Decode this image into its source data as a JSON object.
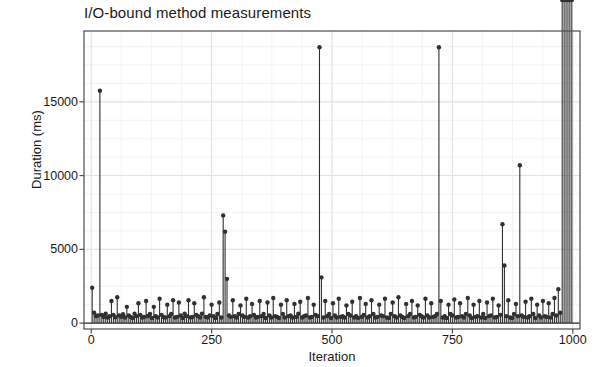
{
  "chart_data": {
    "type": "line",
    "style": "stem",
    "title": "I/O-bound method measurements",
    "xlabel": "Iteration",
    "ylabel": "Duration (ms)",
    "xlim": [
      -15,
      1015
    ],
    "ylim": [
      -400,
      19800
    ],
    "grid": true,
    "grid_minor": true,
    "legend": null,
    "marker": "circle",
    "series_color": "#303030",
    "xticks": [
      0,
      250,
      500,
      750,
      1000
    ],
    "xtick_labels": [
      "0",
      "250",
      "500",
      "750",
      "1000"
    ],
    "yticks": [
      0,
      5000,
      10000,
      15000
    ],
    "ytick_labels": [
      "0",
      "5000",
      "10000",
      "15000"
    ],
    "x": [
      2,
      6,
      10,
      14,
      18,
      22,
      26,
      30,
      34,
      38,
      42,
      46,
      50,
      54,
      58,
      62,
      66,
      70,
      74,
      78,
      82,
      86,
      90,
      94,
      98,
      102,
      106,
      110,
      114,
      118,
      122,
      126,
      130,
      134,
      138,
      142,
      146,
      150,
      154,
      158,
      162,
      166,
      170,
      174,
      178,
      182,
      186,
      190,
      194,
      198,
      202,
      206,
      210,
      214,
      218,
      222,
      226,
      230,
      234,
      238,
      242,
      246,
      250,
      254,
      258,
      262,
      266,
      270,
      274,
      278,
      282,
      286,
      290,
      294,
      298,
      302,
      306,
      310,
      314,
      318,
      322,
      326,
      330,
      334,
      338,
      342,
      346,
      350,
      354,
      358,
      362,
      366,
      370,
      374,
      378,
      382,
      386,
      390,
      394,
      398,
      402,
      406,
      410,
      414,
      418,
      422,
      426,
      430,
      434,
      438,
      442,
      446,
      450,
      454,
      458,
      462,
      466,
      470,
      474,
      478,
      482,
      486,
      490,
      494,
      498,
      502,
      506,
      510,
      514,
      518,
      522,
      526,
      530,
      534,
      538,
      542,
      546,
      550,
      554,
      558,
      562,
      566,
      570,
      574,
      578,
      582,
      586,
      590,
      594,
      598,
      602,
      606,
      610,
      614,
      618,
      622,
      626,
      630,
      634,
      638,
      642,
      646,
      650,
      654,
      658,
      662,
      666,
      670,
      674,
      678,
      682,
      686,
      690,
      694,
      698,
      702,
      706,
      710,
      714,
      718,
      722,
      726,
      730,
      734,
      738,
      742,
      746,
      750,
      754,
      758,
      762,
      766,
      770,
      774,
      778,
      782,
      786,
      790,
      794,
      798,
      802,
      806,
      810,
      814,
      818,
      822,
      826,
      830,
      834,
      838,
      842,
      846,
      850,
      854,
      858,
      862,
      866,
      870,
      874,
      878,
      882,
      886,
      890,
      894,
      898,
      902,
      906,
      910,
      914,
      918,
      922,
      926,
      930,
      934,
      938,
      942,
      946,
      950,
      954,
      958,
      962,
      966,
      970,
      974,
      978,
      982,
      986,
      990,
      994,
      998
    ],
    "y": [
      2400,
      700,
      480,
      520,
      15750,
      560,
      420,
      640,
      380,
      470,
      1500,
      560,
      400,
      1750,
      520,
      430,
      600,
      380,
      1100,
      520,
      420,
      350,
      640,
      470,
      1350,
      560,
      380,
      420,
      1500,
      480,
      620,
      350,
      1100,
      470,
      380,
      1650,
      560,
      420,
      380,
      1250,
      470,
      620,
      1550,
      380,
      420,
      1400,
      520,
      350,
      640,
      470,
      1550,
      380,
      420,
      1350,
      560,
      470,
      380,
      640,
      1750,
      420,
      380,
      520,
      1250,
      470,
      350,
      620,
      1400,
      380,
      7300,
      6200,
      3000,
      520,
      420,
      1550,
      470,
      380,
      620,
      1200,
      520,
      420,
      1650,
      380,
      470,
      1300,
      560,
      380,
      420,
      1500,
      470,
      620,
      350,
      1400,
      520,
      380,
      1700,
      470,
      420,
      350,
      1250,
      620,
      380,
      1550,
      470,
      520,
      380,
      1300,
      420,
      640,
      1450,
      380,
      470,
      520,
      1700,
      380,
      420,
      1250,
      560,
      470,
      18700,
      3100,
      380,
      1500,
      470,
      620,
      350,
      1350,
      520,
      380,
      1650,
      420,
      470,
      380,
      1200,
      620,
      520,
      1450,
      380,
      470,
      350,
      1700,
      420,
      560,
      1300,
      380,
      470,
      1550,
      620,
      380,
      420,
      1250,
      520,
      470,
      1650,
      380,
      350,
      620,
      1400,
      470,
      380,
      1750,
      520,
      420,
      350,
      1300,
      470,
      620,
      1500,
      380,
      420,
      1200,
      560,
      470,
      380,
      1650,
      520,
      380,
      1350,
      420,
      470,
      620,
      18700,
      1500,
      380,
      470,
      350,
      1250,
      620,
      520,
      1600,
      380,
      420,
      1350,
      470,
      380,
      620,
      1700,
      520,
      350,
      1250,
      420,
      470,
      1500,
      380,
      620,
      350,
      1400,
      470,
      520,
      1650,
      380,
      420,
      1200,
      560,
      6700,
      3900,
      470,
      1550,
      380,
      350,
      620,
      1300,
      470,
      10700,
      520,
      420,
      1450,
      380,
      470,
      1650,
      620,
      350,
      1250,
      520,
      380,
      1500,
      470,
      420,
      1350,
      380,
      620,
      1700,
      520,
      2300,
      700
    ]
  }
}
